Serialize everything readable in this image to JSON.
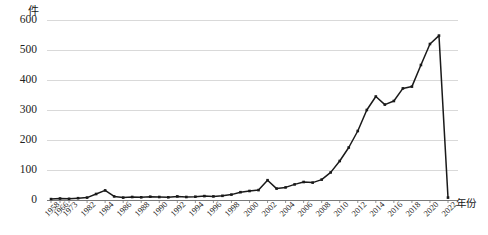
{
  "chart_data": {
    "type": "line",
    "title": "",
    "xlabel": "年份",
    "ylabel": "件",
    "y_unit_label": "件",
    "x_axis_title": "年份",
    "ylim": [
      0,
      600
    ],
    "yticks": [
      0,
      100,
      200,
      300,
      400,
      500,
      600
    ],
    "ytick_labels": [
      "0",
      "100",
      "200",
      "300",
      "400",
      "500",
      "600"
    ],
    "grid": true,
    "grid_axis": "y",
    "legend": "none",
    "line_color": "#1a1a1a",
    "marker": "square",
    "marker_color": "#1a1a1a",
    "grid_color": "#d9d9d9",
    "categories": [
      "1958",
      "1966",
      "1973",
      "1979",
      "1982",
      "1983",
      "1984",
      "1985",
      "1986",
      "1987",
      "1988",
      "1989",
      "1990",
      "1991",
      "1992",
      "1993",
      "1994",
      "1995",
      "1996",
      "1997",
      "1998",
      "1999",
      "2000",
      "2001",
      "2002",
      "2003",
      "2004",
      "2005",
      "2006",
      "2007",
      "2008",
      "2009",
      "2010",
      "2011",
      "2012",
      "2013",
      "2014",
      "2015",
      "2016",
      "2017",
      "2018",
      "2019",
      "2020",
      "2021",
      "2022"
    ],
    "tick_labels_shown": [
      "1958",
      "1966",
      "1973",
      "1982",
      "1984",
      "1986",
      "1988",
      "1990",
      "1992",
      "1994",
      "1996",
      "1998",
      "2000",
      "2002",
      "2004",
      "2006",
      "2008",
      "2010",
      "2012",
      "2014",
      "2016",
      "2018",
      "2020",
      "2022"
    ],
    "values": [
      3,
      5,
      4,
      6,
      8,
      20,
      32,
      12,
      8,
      10,
      9,
      11,
      10,
      9,
      12,
      10,
      11,
      13,
      12,
      14,
      18,
      26,
      30,
      33,
      66,
      38,
      42,
      52,
      60,
      58,
      68,
      92,
      130,
      175,
      230,
      300,
      345,
      318,
      330,
      372,
      378,
      450,
      520,
      548,
      8
    ],
    "values_note": "件 (number of cases) per year",
    "peak": {
      "year": "2021",
      "value": 548
    },
    "xlim_categories": [
      0,
      44
    ]
  }
}
